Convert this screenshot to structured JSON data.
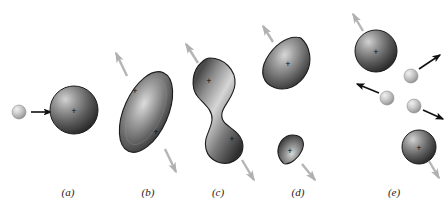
{
  "figure": {
    "background_color": "#ffffff",
    "width": 444,
    "height": 213
  },
  "colors": {
    "nucleus_dark": "#2f2f2f",
    "nucleus_mid": "#6e6e6e",
    "nucleus_highlight": "#d2d2d2",
    "neutron_light": "#cfcfcf",
    "neutron_shadow": "#8f8f8f",
    "neutron_highlight": "#eeeeee",
    "arrow_black": "#111111",
    "arrow_gray": "#b5b5b5",
    "outline": "#1c1c1c",
    "label_text": "#1a1a1a"
  },
  "panels": [
    {
      "id": "a",
      "label": "(a)",
      "label_x": 68,
      "label_y": 196,
      "caption_stage": "Neutron approaches nucleus",
      "bodies": [
        {
          "name": "incident-neutron",
          "kind": "neutron",
          "cx": 19,
          "cy": 112,
          "r": 7
        },
        {
          "name": "target-nucleus",
          "kind": "sphere",
          "cx": 74,
          "cy": 110,
          "r": 24,
          "charge_marks": [
            {
              "x": 74,
              "y": 112
            }
          ]
        }
      ],
      "arrows": [
        {
          "name": "neutron-motion-arrow",
          "style": "black",
          "x1": 31,
          "y1": 112,
          "x2": 51,
          "y2": 112
        }
      ]
    },
    {
      "id": "b",
      "label": "(b)",
      "label_x": 148,
      "label_y": 196,
      "caption_stage": "Nucleus elongates and oscillates",
      "bodies": [
        {
          "name": "elongated-nucleus",
          "kind": "ellipse",
          "cx": 146,
          "cy": 112,
          "rx": 22,
          "ry": 43,
          "rotation": 24,
          "charge_marks": [
            {
              "x": 135,
              "y": 92
            },
            {
              "x": 156,
              "y": 133
            }
          ]
        }
      ],
      "arrows": [
        {
          "name": "deformation-arrow-upper",
          "style": "gray",
          "x1": 127,
          "y1": 76,
          "x2": 116,
          "y2": 53
        },
        {
          "name": "deformation-arrow-lower",
          "style": "gray",
          "x1": 165,
          "y1": 149,
          "x2": 176,
          "y2": 172
        }
      ]
    },
    {
      "id": "c",
      "label": "(c)",
      "label_x": 218,
      "label_y": 196,
      "caption_stage": "Neck forms between two lobes",
      "bodies": [
        {
          "name": "necked-nucleus",
          "kind": "dumbbell",
          "cx": 219,
          "cy": 104,
          "charge_marks": [
            {
              "x": 209,
              "y": 82
            },
            {
              "x": 232,
              "y": 140
            }
          ]
        }
      ],
      "arrows": [
        {
          "name": "separation-arrow-upper",
          "style": "gray",
          "x1": 198,
          "y1": 63,
          "x2": 186,
          "y2": 44
        },
        {
          "name": "separation-arrow-lower",
          "style": "gray",
          "x1": 242,
          "y1": 160,
          "x2": 254,
          "y2": 180
        }
      ]
    },
    {
      "id": "d",
      "label": "(d)",
      "label_x": 298,
      "label_y": 196,
      "caption_stage": "Fragments separate",
      "bodies": [
        {
          "name": "fission-fragment-large",
          "kind": "teardrop",
          "cx": 288,
          "cy": 63,
          "scale": 1.0,
          "rotation": 28,
          "charge_marks": [
            {
              "x": 288,
              "y": 65
            }
          ]
        },
        {
          "name": "fission-fragment-small",
          "kind": "teardrop",
          "cx": 290,
          "cy": 150,
          "scale": 0.55,
          "rotation": 205,
          "charge_marks": [
            {
              "x": 290,
              "y": 152
            }
          ]
        }
      ],
      "arrows": [
        {
          "name": "fragment-large-velocity-arrow",
          "style": "gray",
          "x1": 273,
          "y1": 42,
          "x2": 263,
          "y2": 26
        },
        {
          "name": "fragment-small-velocity-arrow",
          "style": "gray",
          "x1": 302,
          "y1": 164,
          "x2": 315,
          "y2": 180
        }
      ]
    },
    {
      "id": "e",
      "label": "(e)",
      "label_x": 394,
      "label_y": 196,
      "caption_stage": "Two fragments plus emitted neutrons fly apart",
      "bodies": [
        {
          "name": "daughter-nucleus-large",
          "kind": "sphere",
          "cx": 376,
          "cy": 51,
          "r": 21,
          "charge_marks": [
            {
              "x": 376,
              "y": 53
            }
          ]
        },
        {
          "name": "daughter-nucleus-small",
          "kind": "sphere",
          "cx": 419,
          "cy": 147,
          "r": 17,
          "charge_marks": [
            {
              "x": 419,
              "y": 149
            }
          ]
        },
        {
          "name": "emitted-neutron-1",
          "kind": "neutron",
          "cx": 411,
          "cy": 76,
          "r": 7
        },
        {
          "name": "emitted-neutron-2",
          "kind": "neutron",
          "cx": 387,
          "cy": 98,
          "r": 7
        },
        {
          "name": "emitted-neutron-3",
          "kind": "neutron",
          "cx": 414,
          "cy": 106,
          "r": 7
        }
      ],
      "arrows": [
        {
          "name": "daughter-large-velocity-arrow",
          "style": "gray",
          "x1": 363,
          "y1": 31,
          "x2": 353,
          "y2": 14
        },
        {
          "name": "daughter-small-velocity-arrow",
          "style": "gray",
          "x1": 429,
          "y1": 161,
          "x2": 439,
          "y2": 178
        },
        {
          "name": "neutron-1-velocity-arrow",
          "style": "black",
          "x1": 419,
          "y1": 69,
          "x2": 440,
          "y2": 55
        },
        {
          "name": "neutron-2-velocity-arrow",
          "style": "black",
          "x1": 379,
          "y1": 93,
          "x2": 357,
          "y2": 84
        },
        {
          "name": "neutron-3-velocity-arrow",
          "style": "black",
          "x1": 423,
          "y1": 110,
          "x2": 443,
          "y2": 119
        }
      ]
    }
  ],
  "charge_symbol": "+"
}
